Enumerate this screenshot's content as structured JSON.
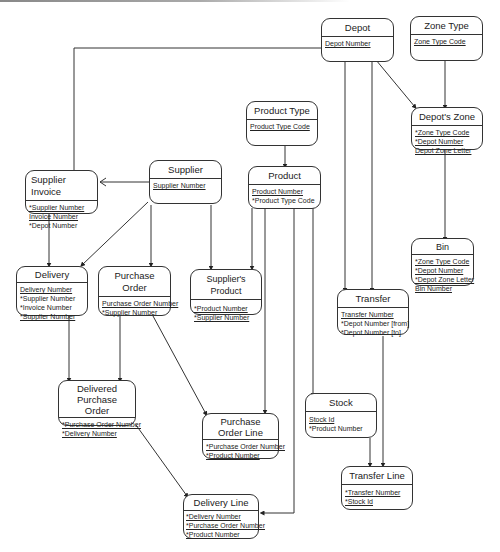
{
  "diagram": {
    "type": "entity-relationship",
    "entities": [
      {
        "id": "depot",
        "title": "Depot",
        "attributes": [
          {
            "text": "Depot Number",
            "key": true
          }
        ]
      },
      {
        "id": "zone_type",
        "title": "Zone Type",
        "attributes": [
          {
            "text": "Zone Type Code",
            "key": true
          }
        ]
      },
      {
        "id": "depots_zone",
        "title": "Depot's Zone",
        "attributes": [
          {
            "text": "*Zone Type Code",
            "key": true
          },
          {
            "text": "*Depot Number",
            "key": true
          },
          {
            "text": "Depot Zone Letter",
            "key": true
          }
        ]
      },
      {
        "id": "product_type",
        "title": "Product Type",
        "attributes": [
          {
            "text": "Product Type Code",
            "key": true
          }
        ]
      },
      {
        "id": "supplier_invoice",
        "title": "Supplier Invoice",
        "attributes": [
          {
            "text": "*Supplier Number",
            "key": true
          },
          {
            "text": "Invoice Number",
            "key": true
          },
          {
            "text": "*Depot Number",
            "key": false
          }
        ]
      },
      {
        "id": "supplier",
        "title": "Supplier",
        "attributes": [
          {
            "text": "Supplier Number",
            "key": true
          }
        ]
      },
      {
        "id": "product",
        "title": "Product",
        "attributes": [
          {
            "text": "Product Number",
            "key": true
          },
          {
            "text": "*Product Type Code",
            "key": false
          }
        ]
      },
      {
        "id": "bin",
        "title": "Bin",
        "attributes": [
          {
            "text": "*Zone Type Code",
            "key": true
          },
          {
            "text": "*Depot Number",
            "key": true
          },
          {
            "text": "*Depot Zone Letter",
            "key": true
          },
          {
            "text": "Bin Number",
            "key": true
          }
        ]
      },
      {
        "id": "delivery",
        "title": "Delivery",
        "attributes": [
          {
            "text": "Delivery Number",
            "key": true
          },
          {
            "text": "*Supplier Number",
            "key": false
          },
          {
            "text": "*Invoice Number",
            "key": false
          },
          {
            "text": "*Supplier Number",
            "key": true
          }
        ]
      },
      {
        "id": "purchase_order",
        "title": "Purchase Order",
        "attributes": [
          {
            "text": "Purchase Order Number",
            "key": true
          },
          {
            "text": "*Supplier Number",
            "key": false
          }
        ]
      },
      {
        "id": "suppliers_product",
        "title": "Supplier's Product",
        "attributes": [
          {
            "text": "*Product Number",
            "key": true
          },
          {
            "text": "*Supplier Number",
            "key": true
          }
        ]
      },
      {
        "id": "transfer",
        "title": "Transfer",
        "attributes": [
          {
            "text": "Transfer Number",
            "key": true
          },
          {
            "text": "*Depot Number [from]",
            "key": false
          },
          {
            "text": "*Depot Number [to]",
            "key": false
          }
        ]
      },
      {
        "id": "delivered_po",
        "title": "Delivered Purchase Order",
        "attributes": [
          {
            "text": "*Purchase Order Number",
            "key": true
          },
          {
            "text": "*Delivery Number",
            "key": true
          }
        ]
      },
      {
        "id": "po_line",
        "title": "Purchase Order Line",
        "attributes": [
          {
            "text": "*Purchase Order Number",
            "key": true
          },
          {
            "text": "*Product Number",
            "key": true
          }
        ]
      },
      {
        "id": "stock",
        "title": "Stock",
        "attributes": [
          {
            "text": "Stock Id",
            "key": true
          },
          {
            "text": "*Product Number",
            "key": false
          }
        ]
      },
      {
        "id": "transfer_line",
        "title": "Transfer Line",
        "attributes": [
          {
            "text": "*Transfer Number",
            "key": true
          },
          {
            "text": "*Stock Id",
            "key": true
          }
        ]
      },
      {
        "id": "delivery_line",
        "title": "Delivery Line",
        "attributes": [
          {
            "text": "*Delivery Number",
            "key": true
          },
          {
            "text": "*Purchase Order Number",
            "key": true
          },
          {
            "text": "*Product Number",
            "key": true
          }
        ]
      }
    ],
    "relationships": [
      {
        "from": "depot",
        "to": "supplier_invoice"
      },
      {
        "from": "depot",
        "to": "depots_zone"
      },
      {
        "from": "zone_type",
        "to": "depots_zone"
      },
      {
        "from": "depot",
        "to": "transfer",
        "label": "from"
      },
      {
        "from": "depot",
        "to": "transfer",
        "label": "to"
      },
      {
        "from": "depots_zone",
        "to": "bin"
      },
      {
        "from": "product_type",
        "to": "product"
      },
      {
        "from": "supplier",
        "to": "supplier_invoice"
      },
      {
        "from": "supplier_invoice",
        "to": "delivery"
      },
      {
        "from": "supplier",
        "to": "delivery"
      },
      {
        "from": "supplier",
        "to": "purchase_order"
      },
      {
        "from": "supplier",
        "to": "suppliers_product"
      },
      {
        "from": "product",
        "to": "suppliers_product"
      },
      {
        "from": "product",
        "to": "po_line"
      },
      {
        "from": "product",
        "to": "stock"
      },
      {
        "from": "product",
        "to": "delivery_line"
      },
      {
        "from": "delivery",
        "to": "delivered_po"
      },
      {
        "from": "purchase_order",
        "to": "delivered_po"
      },
      {
        "from": "purchase_order",
        "to": "po_line"
      },
      {
        "from": "delivered_po",
        "to": "delivery_line"
      },
      {
        "from": "transfer",
        "to": "transfer_line"
      },
      {
        "from": "stock",
        "to": "transfer_line"
      }
    ]
  }
}
